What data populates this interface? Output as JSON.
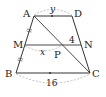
{
  "diagram": {
    "type": "trapezoid-geometry",
    "points": {
      "A": {
        "label": "A",
        "x": 34,
        "y": 16
      },
      "D": {
        "label": "D",
        "x": 72,
        "y": 16
      },
      "M": {
        "label": "M",
        "x": 25,
        "y": 45
      },
      "N": {
        "label": "N",
        "x": 81,
        "y": 45
      },
      "B": {
        "label": "B",
        "x": 16,
        "y": 73
      },
      "C": {
        "label": "C",
        "x": 90,
        "y": 73
      },
      "P": {
        "label": "P",
        "x": 61,
        "y": 45
      }
    },
    "measures": {
      "AD": "y",
      "MP": "x",
      "PN": "4",
      "BC": "16"
    },
    "colors": {
      "line": "#333333",
      "dashed": "#999999",
      "text": "#222222"
    }
  }
}
